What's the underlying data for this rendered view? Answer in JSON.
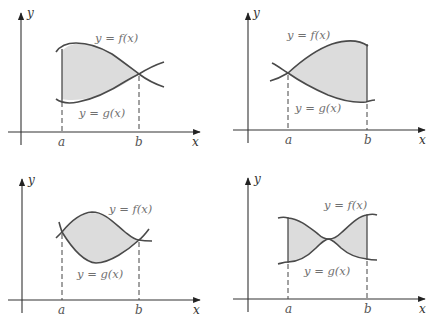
{
  "figure": {
    "panels": [
      {
        "id": "top-left",
        "f_label": "y = f(x)",
        "g_label": "y = g(x)",
        "x_axis_label": "x",
        "y_axis_label": "y",
        "a_label": "a",
        "b_label": "b",
        "description": "f above g on [a,b]; curves cross at b"
      },
      {
        "id": "top-right",
        "f_label": "y = f(x)",
        "g_label": "y = g(x)",
        "x_axis_label": "x",
        "y_axis_label": "y",
        "a_label": "a",
        "b_label": "b",
        "description": "f above g on [a,b]; curves cross at a"
      },
      {
        "id": "bottom-left",
        "f_label": "y = f(x)",
        "g_label": "y = g(x)",
        "x_axis_label": "x",
        "y_axis_label": "y",
        "a_label": "a",
        "b_label": "b",
        "description": "f above g on [a,b]; curves cross at both a and b"
      },
      {
        "id": "bottom-right",
        "f_label": "y = f(x)",
        "g_label": "y = g(x)",
        "x_axis_label": "x",
        "y_axis_label": "y",
        "a_label": "a",
        "b_label": "b",
        "description": "f above g on [a,b]; curves touch at an interior point"
      }
    ],
    "colors": {
      "shading": "#dcdcdc",
      "curve": "#4a4a4a",
      "axis": "#333333",
      "label": "#707070"
    }
  }
}
